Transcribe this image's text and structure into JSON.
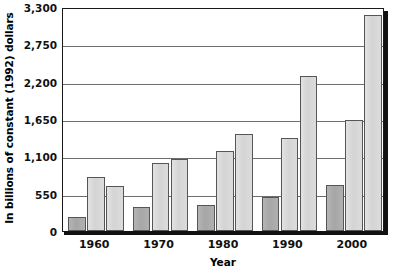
{
  "chart_data": {
    "type": "bar",
    "title": "",
    "xlabel": "Year",
    "ylabel": "In billions of constant (1992) dollars",
    "categories": [
      "1960",
      "1970",
      "1980",
      "1990",
      "2000"
    ],
    "ylim": [
      0,
      3300
    ],
    "yticks": [
      0,
      550,
      1100,
      1650,
      2200,
      2750,
      3300
    ],
    "ytick_labels": [
      "0",
      "550",
      "1,100",
      "1,650",
      "2,200",
      "2,750",
      "3,300"
    ],
    "grid": true,
    "legend": "none",
    "series": [
      {
        "name": "series-1",
        "color": "#b0b0b0",
        "values": [
          200,
          350,
          390,
          500,
          680
        ]
      },
      {
        "name": "series-2",
        "color": "#dcdcdc",
        "values": [
          790,
          1000,
          1180,
          1370,
          1630
        ]
      },
      {
        "name": "series-3",
        "color": "#dcdcdc",
        "values": [
          660,
          1060,
          1430,
          2290,
          3180
        ]
      }
    ]
  },
  "axes": {
    "y_title": "In billions of constant (1992) dollars",
    "x_title": "Year"
  }
}
